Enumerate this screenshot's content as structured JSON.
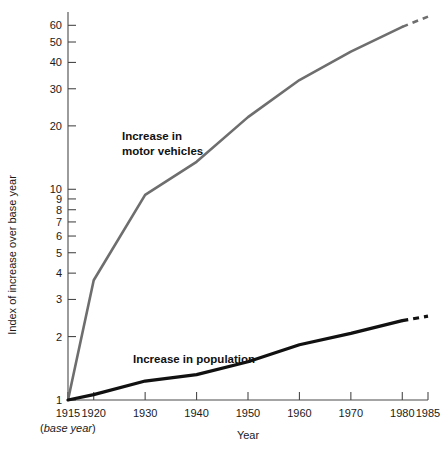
{
  "chart_data": {
    "type": "line",
    "title": "",
    "xlabel": "Year",
    "ylabel": "Index of increase over base year",
    "yscale": "log",
    "ylim": [
      1,
      65
    ],
    "xlim": [
      1915,
      1985
    ],
    "grid": false,
    "legend_position": "inline-annotations",
    "x_ticks": [
      1915,
      1920,
      1930,
      1940,
      1950,
      1960,
      1970,
      1980,
      1985
    ],
    "x_tick_labels": [
      "1915",
      "1920",
      "1930",
      "1940",
      "1950",
      "1960",
      "1970",
      "1980",
      "1985"
    ],
    "y_ticks": [
      1,
      2,
      3,
      4,
      5,
      6,
      7,
      8,
      9,
      10,
      20,
      30,
      40,
      50,
      60
    ],
    "y_tick_labels": [
      "1",
      "2",
      "3",
      "4",
      "5",
      "6",
      "7",
      "8",
      "9",
      "10",
      "20",
      "30",
      "40",
      "50",
      "60"
    ],
    "base_year_note": "(base year)",
    "base_year_note_prefix": "(",
    "base_year_note_italic": "base year",
    "base_year_note_suffix": ")",
    "series": [
      {
        "name": "Increase in motor vehicles",
        "color": "#6e6e6e",
        "width": 2.6,
        "annotation_line1": "Increase in",
        "annotation_line2": "motor vehicles",
        "x": [
          1915,
          1920,
          1930,
          1940,
          1950,
          1960,
          1970,
          1980
        ],
        "values": [
          1.0,
          3.7,
          9.4,
          13.5,
          22.0,
          33.0,
          45.0,
          59.0
        ],
        "projection_x": [
          1980,
          1985
        ],
        "projection_values": [
          59.0,
          66.0
        ],
        "projection_style": "dashed"
      },
      {
        "name": "Increase in population",
        "color": "#111111",
        "width": 3.2,
        "annotation_line1": "Increase in population",
        "annotation_line2": "",
        "x": [
          1915,
          1920,
          1930,
          1940,
          1950,
          1960,
          1970,
          1980
        ],
        "values": [
          1.0,
          1.06,
          1.23,
          1.32,
          1.52,
          1.83,
          2.07,
          2.38
        ],
        "projection_x": [
          1980,
          1985
        ],
        "projection_values": [
          2.38,
          2.5
        ],
        "projection_style": "dashed"
      }
    ]
  },
  "axes": {
    "y_title": "Index of increase over base year",
    "x_title": "Year"
  }
}
